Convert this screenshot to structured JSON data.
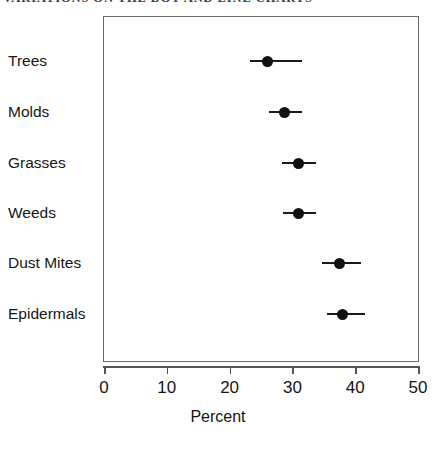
{
  "figure": {
    "title": "VARIATIONS ON THE DOT AND LINE CHARTS"
  },
  "chart_data": {
    "type": "scatter",
    "title": "VARIATIONS ON THE DOT AND LINE CHARTS",
    "xlabel": "Percent",
    "ylabel": "",
    "xlim": [
      0,
      50
    ],
    "xticks": [
      0,
      10,
      20,
      30,
      40,
      50
    ],
    "xtick_labels": [
      "0",
      "10",
      "20",
      "30",
      "40",
      "50"
    ],
    "grid": false,
    "legend": false,
    "orientation": "horizontal",
    "marker": "filled-circle",
    "error_bars": "horizontal",
    "categories": [
      "Trees",
      "Molds",
      "Grasses",
      "Weeds",
      "Dust Mites",
      "Epidermals"
    ],
    "values": [
      26.0,
      28.8,
      31.0,
      31.0,
      37.5,
      38.0
    ],
    "error_low": [
      23.3,
      26.3,
      28.3,
      28.5,
      34.7,
      35.5
    ],
    "error_high": [
      31.5,
      31.5,
      33.8,
      33.8,
      41.0,
      41.5
    ],
    "points": [
      {
        "category": "Trees",
        "value": 26.0,
        "low": 23.3,
        "high": 31.5
      },
      {
        "category": "Molds",
        "value": 28.8,
        "low": 26.3,
        "high": 31.5
      },
      {
        "category": "Grasses",
        "value": 31.0,
        "low": 28.3,
        "high": 33.8
      },
      {
        "category": "Weeds",
        "value": 31.0,
        "low": 28.5,
        "high": 33.8
      },
      {
        "category": "Dust Mites",
        "value": 37.5,
        "low": 34.7,
        "high": 41.0
      },
      {
        "category": "Epidermals",
        "value": 38.0,
        "low": 35.5,
        "high": 41.5
      }
    ],
    "colors": {
      "marker": "#111111",
      "error_bar": "#1a1a1a",
      "frame": "#6b6b6b",
      "axis": "#555555",
      "text": "#141414",
      "background": "#ffffff"
    }
  }
}
